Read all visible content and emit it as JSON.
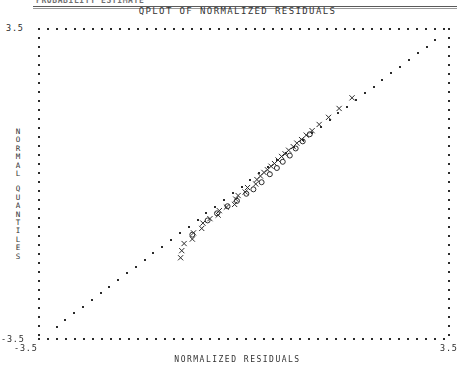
{
  "document_header": {
    "text": "PROBABILITY ESTIMATE"
  },
  "chart_title": "QPLOT OF NORMALIZED RESIDUALS",
  "axes": {
    "x_title": "NORMALIZED RESIDUALS",
    "y_title_lines": [
      "NORMAL",
      "QUANTILES"
    ],
    "x_min_label": "-3.5",
    "x_max_label": "3.5",
    "y_min_label": "-3.5",
    "y_max_label": "3.5"
  },
  "colors": {
    "ink": "#2b2b2b",
    "rule": "#5a5a5a",
    "paper": "#ffffff"
  },
  "chart_data": {
    "type": "scatter",
    "title": "QPLOT OF NORMALIZED RESIDUALS",
    "xlabel": "NORMALIZED RESIDUALS",
    "ylabel": "NORMAL QUANTILES",
    "xlim": [
      -3.5,
      3.5
    ],
    "ylim": [
      -3.5,
      3.5
    ],
    "grid": false,
    "legend": "none",
    "frame": "dotted",
    "series": [
      {
        "name": "reference line",
        "marker": "dot",
        "x": [
          -3.2,
          -3.05,
          -2.9,
          -2.75,
          -2.6,
          -2.45,
          -2.3,
          -2.15,
          -2.0,
          -1.85,
          -1.7,
          -1.55,
          -1.4,
          -1.25,
          -1.1,
          -0.95,
          -0.8,
          -0.65,
          -0.5,
          -0.35,
          -0.2,
          -0.05,
          0.1,
          0.25,
          0.4,
          0.55,
          0.7,
          0.85,
          1.0,
          1.15,
          1.3,
          1.45,
          1.6,
          1.75,
          1.9,
          2.05,
          2.2,
          2.35,
          2.5,
          2.65,
          2.8,
          2.95,
          3.1,
          3.25
        ],
        "y": [
          -3.2,
          -3.05,
          -2.9,
          -2.75,
          -2.6,
          -2.45,
          -2.3,
          -2.15,
          -2.0,
          -1.85,
          -1.7,
          -1.55,
          -1.4,
          -1.25,
          -1.1,
          -0.95,
          -0.8,
          -0.65,
          -0.5,
          -0.35,
          -0.2,
          -0.05,
          0.1,
          0.25,
          0.4,
          0.55,
          0.7,
          0.85,
          1.0,
          1.15,
          1.3,
          1.45,
          1.6,
          1.75,
          1.9,
          2.05,
          2.2,
          2.35,
          2.5,
          2.65,
          2.8,
          2.95,
          3.1,
          3.25
        ]
      },
      {
        "name": "X residuals",
        "marker": "x",
        "x": [
          -1.08,
          -1.06,
          -1.02,
          -0.88,
          -0.86,
          -0.72,
          -0.7,
          -0.58,
          -0.44,
          -0.42,
          -0.3,
          -0.16,
          -0.14,
          -0.1,
          0.02,
          0.06,
          0.2,
          0.22,
          0.28,
          0.34,
          0.4,
          0.46,
          0.52,
          0.58,
          0.64,
          0.7,
          0.76,
          0.84,
          0.9,
          0.98,
          1.06,
          1.16,
          1.28,
          1.44,
          1.62,
          1.84
        ],
        "y": [
          -1.66,
          -1.5,
          -1.34,
          -1.24,
          -1.1,
          -1.0,
          -0.88,
          -0.78,
          -0.7,
          -0.6,
          -0.52,
          -0.46,
          -0.34,
          -0.26,
          -0.18,
          -0.08,
          0.0,
          0.1,
          0.18,
          0.26,
          0.32,
          0.4,
          0.46,
          0.54,
          0.62,
          0.68,
          0.76,
          0.84,
          0.92,
          1.0,
          1.1,
          1.2,
          1.34,
          1.5,
          1.7,
          1.94
        ]
      },
      {
        "name": "O residuals",
        "marker": "o",
        "x": [
          -0.88,
          -0.62,
          -0.46,
          -0.28,
          -0.12,
          0.04,
          0.16,
          0.3,
          0.44,
          0.56,
          0.66,
          0.78,
          0.88,
          1.0,
          1.12
        ],
        "y": [
          -1.14,
          -0.82,
          -0.66,
          -0.5,
          -0.38,
          -0.22,
          -0.12,
          0.04,
          0.22,
          0.36,
          0.5,
          0.64,
          0.8,
          0.96,
          1.12
        ]
      }
    ]
  }
}
